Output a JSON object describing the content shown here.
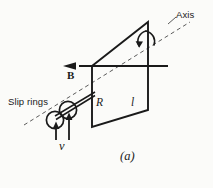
{
  "figure": {
    "caption": "(a)",
    "background_color": "#fbfbf9",
    "ink_color": "#1a1a1a",
    "labels": {
      "slip_rings": "Slip rings",
      "axis": "Axis",
      "magnetic_field": "B",
      "resistance": "R",
      "length": "l",
      "velocity": "ᴠ"
    },
    "icons": {
      "field_arrow": "left-arrow-icon",
      "rotation_arrow": "curved-rotation-arrow-icon",
      "velocity_arrow_left": "up-arrow-icon",
      "velocity_arrow_right": "up-arrow-icon",
      "axis_dashed_line": "dashed-axis-line-icon",
      "slip_ring_left": "circle-icon",
      "slip_ring_right": "circle-icon",
      "loop": "parallelogram-loop-icon",
      "shaft": "shaft-icon"
    }
  }
}
